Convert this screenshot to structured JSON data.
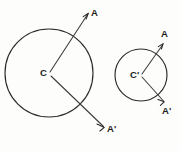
{
  "figure": {
    "background_color": "#fdfdfb",
    "ink_color": "#2b2b2b",
    "canvas": {
      "width": 180,
      "height": 151
    },
    "shapes": [
      {
        "name": "large-circle",
        "center_label": "C",
        "center_x": 49,
        "center_y": 73,
        "radius": 44
      },
      {
        "name": "small-circle",
        "center_label": "C'",
        "center_x": 141,
        "center_y": 75,
        "radius": 26
      }
    ],
    "rays": [
      {
        "name": "large-circle-ray-a",
        "label": "A",
        "from_x": 49,
        "from_y": 73,
        "to_x": 88,
        "to_y": 14
      },
      {
        "name": "large-circle-ray-a-prime",
        "label": "A'",
        "from_x": 49,
        "from_y": 73,
        "to_x": 104,
        "to_y": 127
      },
      {
        "name": "small-circle-ray-a",
        "label": "A",
        "from_x": 141,
        "from_y": 75,
        "to_x": 163,
        "to_y": 44
      },
      {
        "name": "small-circle-ray-a-prime",
        "label": "A'",
        "from_x": 141,
        "from_y": 75,
        "to_x": 164,
        "to_y": 102
      }
    ],
    "labels": {
      "large_center": "C",
      "large_ray_upper": "A",
      "large_ray_lower": "A'",
      "small_center": "C'",
      "small_ray_upper": "A",
      "small_ray_lower": "A'"
    }
  }
}
